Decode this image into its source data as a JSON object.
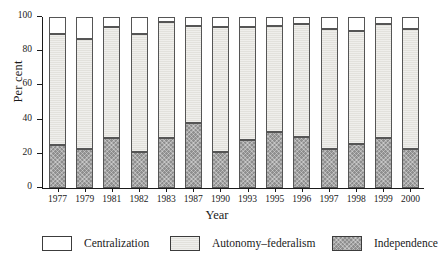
{
  "chart_data": {
    "type": "bar",
    "subtype": "stacked-bar-100",
    "title": "",
    "xlabel": "Year",
    "ylabel": "Per cent",
    "ylim": [
      0,
      100
    ],
    "yticks": [
      0,
      20,
      40,
      60,
      80,
      100
    ],
    "ytick_labels": [
      "0",
      "20",
      "40",
      "60",
      "80",
      "100"
    ],
    "grid": false,
    "legend_position": "bottom",
    "categories": [
      "1977",
      "1979",
      "1981",
      "1982",
      "1983",
      "1987",
      "1990",
      "1993",
      "1995",
      "1996",
      "1997",
      "1998",
      "1999",
      "2000"
    ],
    "series": [
      {
        "name": "Independence",
        "color": "#8e8e8e",
        "values": [
          25,
          23,
          29,
          21,
          29,
          38,
          21,
          28,
          33,
          30,
          23,
          26,
          29,
          23
        ]
      },
      {
        "name": "Autonomy-federalism",
        "color": "#e2e1dc",
        "values": [
          65,
          64,
          65,
          69,
          68,
          57,
          73,
          66,
          62,
          66,
          70,
          66,
          67,
          70
        ]
      },
      {
        "name": "Centralization",
        "color": "#ffffff",
        "values": [
          10,
          13,
          6,
          10,
          3,
          5,
          6,
          6,
          5,
          4,
          7,
          8,
          4,
          7
        ]
      }
    ],
    "stack_order_bottom_to_top": [
      "Independence",
      "Autonomy-federalism",
      "Centralization"
    ]
  },
  "axes": {
    "y_title": "Per cent",
    "x_title": "Year"
  },
  "legend": {
    "items": [
      {
        "label": "Centralization",
        "swatch": "white-swatch"
      },
      {
        "label": "Autonomy–federalism",
        "swatch": "light-gray-swatch"
      },
      {
        "label": "Independence",
        "swatch": "dark-gray-hatched-swatch"
      }
    ]
  }
}
